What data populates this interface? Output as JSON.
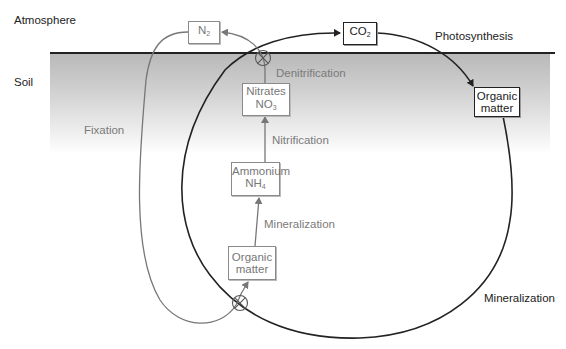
{
  "zones": {
    "atmosphere_label": "Atmosphere",
    "soil_label": "Soil"
  },
  "nodes": {
    "n2": {
      "main": "N",
      "sub": "2"
    },
    "co2": {
      "main": "CO",
      "sub": "2"
    },
    "nitrates": {
      "line1": "Nitrates",
      "main": "NO",
      "sub": "3"
    },
    "ammonium": {
      "line1": "Ammonium",
      "main": "NH",
      "sub": "4"
    },
    "organic_matter_soil": {
      "line1": "Organic",
      "line2": "matter"
    },
    "organic_matter_surface": {
      "line1": "Organic",
      "line2": "matter"
    }
  },
  "processes": {
    "photosynthesis": "Photosynthesis",
    "denitrification": "Denitrification",
    "nitrification": "Nitrification",
    "mineralization_inner": "Mineralization",
    "mineralization_outer": "Mineralization",
    "fixation": "Fixation"
  },
  "colors": {
    "carbon_cycle": "#222222",
    "nitrogen_cycle": "#7a7a7a",
    "soil_top": "#b9b9b9"
  }
}
